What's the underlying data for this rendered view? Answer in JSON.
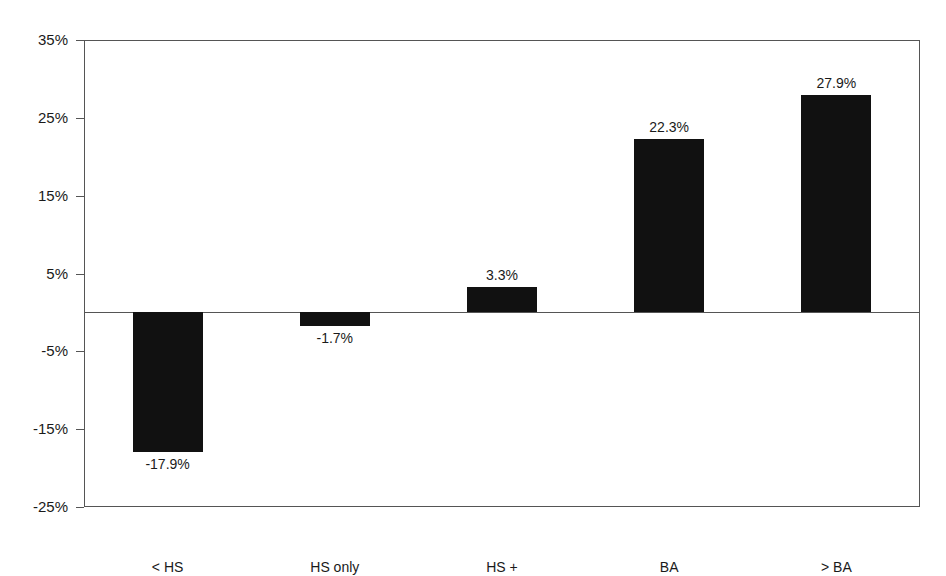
{
  "chart_data": {
    "type": "bar",
    "title": "",
    "subtitle": "",
    "xlabel": "",
    "ylabel": "",
    "categories": [
      "< HS",
      "HS only",
      "HS +",
      "BA",
      "> BA"
    ],
    "values": [
      -17.9,
      -1.7,
      3.3,
      22.3,
      27.9
    ],
    "data_labels": [
      "-17.9%",
      "-1.7%",
      "3.3%",
      "22.3%",
      "27.9%"
    ],
    "ylim": [
      -25,
      35
    ],
    "ytick_values": [
      35,
      25,
      15,
      5,
      -5,
      -15,
      -25
    ],
    "ytick_labels": [
      "35%",
      "25%",
      "15%",
      "5%",
      "-5%",
      "-15%",
      "-25%"
    ],
    "grid": false,
    "legend": false,
    "legend_position": "none",
    "bar_color": "#111111",
    "axis_color": "#555555",
    "background_color": "#ffffff",
    "zero_line": 0
  }
}
